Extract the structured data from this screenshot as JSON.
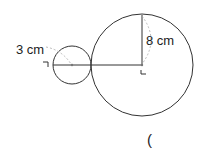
{
  "diagram": {
    "small_circle": {
      "label": "3 cm",
      "cx": 72,
      "cy": 65,
      "r": 19
    },
    "large_circle": {
      "label": "8 cm",
      "cx": 142,
      "cy": 65,
      "r": 51
    },
    "answer_paren": "(",
    "colors": {
      "stroke": "#333333",
      "dashed": "#999999",
      "text": "#222222"
    }
  }
}
